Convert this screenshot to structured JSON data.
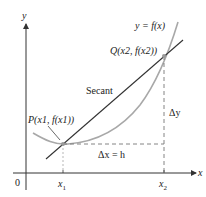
{
  "diagram": {
    "type": "secant-line",
    "axes": {
      "x_label": "x",
      "y_label": "y",
      "origin_label": "0",
      "x_ticks": [
        "x1",
        "x2"
      ]
    },
    "labels": {
      "curve": "y = f(x)",
      "secant": "Secant",
      "point_p": "P(x1, f(x1))",
      "point_q": "Q(x2, f(x2))",
      "delta_x": "Δx = h",
      "delta_y": "Δy"
    },
    "tick_labels": {
      "x1_main": "x",
      "x1_sub": "1",
      "x2_main": "x",
      "x2_sub": "2"
    },
    "colors": {
      "axis": "#333333",
      "secant": "#333333",
      "curve": "#a8a8a8",
      "dashed": "#777777",
      "point": "#999999"
    }
  }
}
